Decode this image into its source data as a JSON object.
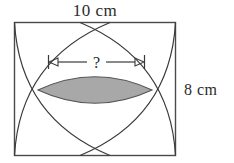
{
  "figure": {
    "title_top_label": "10 cm",
    "right_side_label": "8 cm",
    "unknown_label": "?",
    "colors": {
      "background": "#ffffff",
      "stroke": "#3a3a3a",
      "rect_stroke": "#4a4a4a",
      "lens_fill": "#a8a8a8",
      "lens_stroke": "#555555",
      "text": "#2b2b2b"
    },
    "rectangle": {
      "x": 14,
      "y": 22,
      "width": 162,
      "height": 134,
      "width_label": "10 cm",
      "height_label": "8 cm"
    },
    "arcs": [
      {
        "name": "arc-from-top-left",
        "start_corner": "top-left",
        "end_point": "bottom-center-right"
      },
      {
        "name": "arc-from-top-right",
        "start_corner": "top-right",
        "end_point": "bottom-center-left"
      },
      {
        "name": "arc-from-bottom-left",
        "start_corner": "bottom-left",
        "end_point": "top-center-right"
      },
      {
        "name": "arc-from-bottom-right",
        "start_corner": "bottom-right",
        "end_point": "top-center-left"
      }
    ],
    "lens": {
      "name": "shaded-lens-region",
      "left_point_x": 38,
      "right_point_x": 152,
      "center_y": 90,
      "top_y": 73,
      "bottom_y": 108,
      "fill": "#a8a8a8"
    },
    "dimension_line": {
      "name": "width-dimension",
      "y": 62,
      "left_x": 48,
      "right_x": 145,
      "label": "?",
      "left_arrow": "arrow-left",
      "right_arrow": "arrow-right"
    }
  }
}
